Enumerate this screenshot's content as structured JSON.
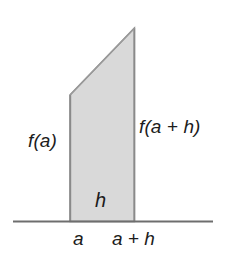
{
  "figure": {
    "kind": "geometry-diagram",
    "canvas": {
      "width": 228,
      "height": 268
    },
    "colors": {
      "background": "#ffffff",
      "region_fill": "#d9d9d9",
      "region_stroke": "#8a8a8a",
      "axis_line": "#6e6e6e",
      "text": "#1c1c1c"
    },
    "axis": {
      "name": "baseline",
      "x_start": 13,
      "x_end": 213,
      "y": 221.5
    },
    "region": {
      "name": "trapezoid",
      "points": [
        {
          "x": 70,
          "y": 95
        },
        {
          "x": 134.5,
          "y": 28
        },
        {
          "x": 134.5,
          "y": 221.5
        },
        {
          "x": 70,
          "y": 221.5
        }
      ]
    },
    "labels": {
      "left_height": "f(a)",
      "right_height": "f(a + h)",
      "width": "h",
      "axis_left_tick": "a",
      "axis_right_tick": "a + h"
    }
  }
}
